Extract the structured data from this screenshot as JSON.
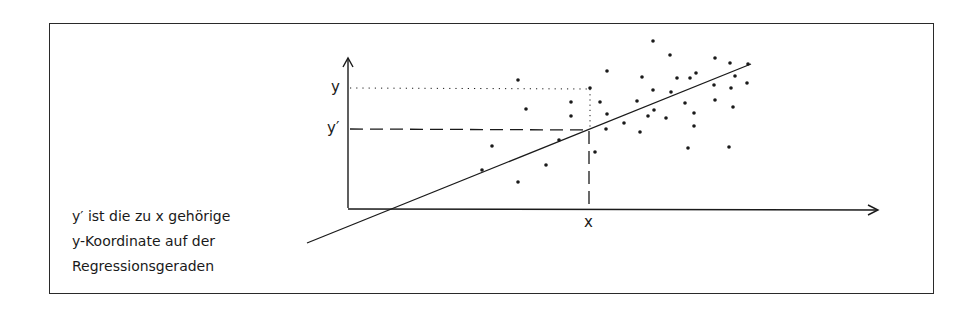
{
  "labels": {
    "y_axis_y": "y",
    "y_axis_y_prime": "y′",
    "x_axis_x": "x"
  },
  "caption": {
    "lines": [
      "y′ ist die zu x gehörige",
      "y-Koordinate auf der",
      "Regressionsgeraden"
    ]
  },
  "colors": {
    "ink": "#1a1a1a",
    "background": "#ffffff"
  },
  "chart_data": {
    "type": "scatter",
    "title": "",
    "xlabel": "x",
    "ylabel": "y",
    "annotations": [
      "y",
      "y′",
      "x",
      "y′ ist die zu x gehörige y-Koordinate auf der Regressionsgeraden"
    ],
    "regression_line": {
      "x1": 307,
      "y1": 243,
      "x2": 751,
      "y2": 64
    },
    "marked_point": {
      "x": 590,
      "y_observed": 88,
      "y_predicted": 129
    },
    "points_px": [
      [
        482,
        170
      ],
      [
        492,
        146
      ],
      [
        518,
        80
      ],
      [
        526,
        109
      ],
      [
        518,
        182
      ],
      [
        546,
        165
      ],
      [
        559,
        140
      ],
      [
        571,
        102
      ],
      [
        571,
        116
      ],
      [
        590,
        88
      ],
      [
        595,
        152
      ],
      [
        600,
        102
      ],
      [
        607,
        71
      ],
      [
        607,
        114
      ],
      [
        606,
        129
      ],
      [
        624,
        123
      ],
      [
        637,
        101
      ],
      [
        640,
        132
      ],
      [
        642,
        77
      ],
      [
        648,
        116
      ],
      [
        653,
        41
      ],
      [
        653,
        90
      ],
      [
        654,
        110
      ],
      [
        666,
        118
      ],
      [
        670,
        55
      ],
      [
        671,
        92
      ],
      [
        677,
        78
      ],
      [
        685,
        103
      ],
      [
        688,
        148
      ],
      [
        690,
        78
      ],
      [
        694,
        113
      ],
      [
        694,
        126
      ],
      [
        696,
        73
      ],
      [
        714,
        85
      ],
      [
        715,
        100
      ],
      [
        715,
        58
      ],
      [
        729,
        147
      ],
      [
        730,
        63
      ],
      [
        731,
        88
      ],
      [
        733,
        107
      ],
      [
        735,
        76
      ],
      [
        747,
        83
      ],
      [
        748,
        64
      ]
    ],
    "grid": false,
    "legend": "none"
  }
}
